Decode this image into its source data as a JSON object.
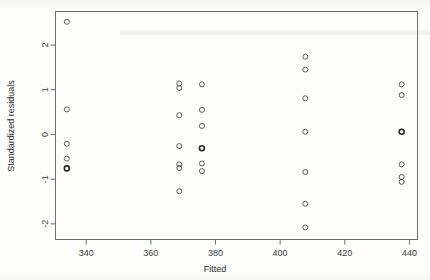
{
  "chart_data": {
    "type": "scatter",
    "title": "",
    "xlabel": "Fitted",
    "ylabel": "Standardized residuals",
    "xlim": [
      330.5,
      442.5
    ],
    "ylim": [
      -2.35,
      2.75
    ],
    "xticks": [
      340,
      360,
      380,
      400,
      420,
      440
    ],
    "yticks": [
      -2,
      -1,
      0,
      1,
      2
    ],
    "xtick_labels": [
      "340",
      "360",
      "380",
      "400",
      "420",
      "440"
    ],
    "ytick_labels": [
      "-2",
      "-1",
      "0",
      "1",
      "2"
    ],
    "grid": false,
    "legend": "none",
    "marker": "open-circle",
    "marker_color": "#4a4a4a",
    "points": [
      {
        "x": 334.0,
        "y": 2.52,
        "overplot": 1
      },
      {
        "x": 334.0,
        "y": 0.56,
        "overplot": 1
      },
      {
        "x": 334.0,
        "y": -0.21,
        "overplot": 1
      },
      {
        "x": 334.0,
        "y": -0.54,
        "overplot": 1
      },
      {
        "x": 334.0,
        "y": -0.76,
        "overplot": 2
      },
      {
        "x": 368.8,
        "y": 1.14,
        "overplot": 1
      },
      {
        "x": 368.8,
        "y": 1.04,
        "overplot": 1
      },
      {
        "x": 368.8,
        "y": 0.43,
        "overplot": 1
      },
      {
        "x": 368.8,
        "y": -0.26,
        "overplot": 1
      },
      {
        "x": 368.8,
        "y": -0.67,
        "overplot": 1
      },
      {
        "x": 368.8,
        "y": -0.75,
        "overplot": 1
      },
      {
        "x": 368.8,
        "y": -1.27,
        "overplot": 1
      },
      {
        "x": 375.8,
        "y": 1.12,
        "overplot": 1
      },
      {
        "x": 375.8,
        "y": 0.55,
        "overplot": 1
      },
      {
        "x": 375.8,
        "y": 0.19,
        "overplot": 1
      },
      {
        "x": 375.8,
        "y": -0.31,
        "overplot": 2
      },
      {
        "x": 375.8,
        "y": -0.65,
        "overplot": 1
      },
      {
        "x": 375.8,
        "y": -0.82,
        "overplot": 1
      },
      {
        "x": 407.8,
        "y": 1.74,
        "overplot": 1
      },
      {
        "x": 407.8,
        "y": 1.45,
        "overplot": 1
      },
      {
        "x": 407.8,
        "y": 0.81,
        "overplot": 1
      },
      {
        "x": 407.8,
        "y": 0.06,
        "overplot": 1
      },
      {
        "x": 407.8,
        "y": -0.84,
        "overplot": 1
      },
      {
        "x": 407.8,
        "y": -1.55,
        "overplot": 1
      },
      {
        "x": 407.8,
        "y": -2.08,
        "overplot": 1
      },
      {
        "x": 437.6,
        "y": 1.12,
        "overplot": 1
      },
      {
        "x": 437.6,
        "y": 0.88,
        "overplot": 1
      },
      {
        "x": 437.6,
        "y": 0.06,
        "overplot": 2
      },
      {
        "x": 437.6,
        "y": -0.67,
        "overplot": 1
      },
      {
        "x": 437.6,
        "y": -0.95,
        "overplot": 1
      },
      {
        "x": 437.6,
        "y": -1.06,
        "overplot": 1
      }
    ]
  }
}
